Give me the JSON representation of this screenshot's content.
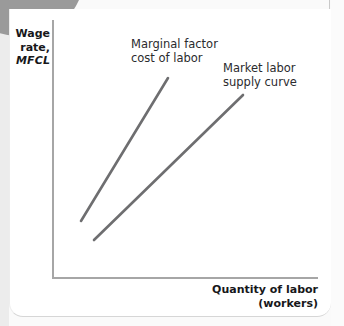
{
  "figure": {
    "y_axis_label_line1": "Wage",
    "y_axis_label_line2": "rate,",
    "y_axis_symbol": "MFCL",
    "x_axis_label_line1": "Quantity of labor",
    "x_axis_label_line2": "(workers)",
    "curve_label_mfcl_line1": "Marginal factor",
    "curve_label_mfcl_line2": "cost of labor",
    "curve_label_supply_line1": "Market labor",
    "curve_label_supply_line2": "supply curve"
  },
  "colors": {
    "curve": "#6e6e70",
    "axis": "#a6a6a6",
    "text": "#17171a",
    "label_text": "#2b2b2e",
    "card": "#ffffff",
    "tab": "#9a9a9a",
    "backdrop": "#fafafa"
  },
  "chart_data": {
    "type": "line",
    "title": "",
    "xlabel": "Quantity of labor (workers)",
    "ylabel": "Wage rate, MFCL",
    "grid": false,
    "legend": "inline-annotations",
    "axis_ticks": {
      "x": [],
      "y": []
    },
    "axis_notes": "Unlabeled schematic axes; origin at lower-left, arrowless L-shaped axes",
    "series": [
      {
        "name": "Marginal factor cost of labor",
        "label_short": "MFCL",
        "shape": "straight upward-sloping line",
        "slope": "steeper",
        "points_px": [
          [
            81,
            221
          ],
          [
            168,
            78
          ]
        ],
        "x": [
          0.11,
          0.44
        ],
        "y": [
          0.22,
          0.78
        ]
      },
      {
        "name": "Market labor supply curve",
        "label_short": "S",
        "shape": "straight upward-sloping line",
        "slope": "flatter",
        "points_px": [
          [
            94,
            240
          ],
          [
            243,
            95
          ]
        ],
        "x": [
          0.16,
          0.72
        ],
        "y": [
          0.15,
          0.71
        ]
      }
    ],
    "annotations": [
      {
        "text": "Marginal factor cost of labor",
        "target_series": "Marginal factor cost of labor",
        "position_px": [
          131,
          38
        ]
      },
      {
        "text": "Market labor supply curve",
        "target_series": "Market labor supply curve",
        "position_px": [
          223,
          62
        ]
      }
    ]
  }
}
